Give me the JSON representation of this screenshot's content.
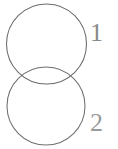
{
  "figure": {
    "kind": "venn-two-circle-diagram",
    "background_color": "#ffffff",
    "stroke_color": "#6b6b6b",
    "label_color": "#8a8a8a",
    "width": 118,
    "height": 149
  },
  "shapes": {
    "top_circle": {
      "name": "circle-1",
      "cx": 46.5,
      "cy": 44,
      "r": 40,
      "stroke": "#6b6b6b"
    },
    "bottom_circle": {
      "name": "circle-2",
      "cx": 46,
      "cy": 106,
      "r": 39,
      "stroke": "#6f6f6f"
    }
  },
  "labels": {
    "top": {
      "text": "1",
      "x": 90,
      "y": 41,
      "font_size": 26,
      "color": "#8a8a8a"
    },
    "bottom": {
      "text": "2",
      "x": 90,
      "y": 131,
      "font_size": 26,
      "color": "#9a9a9a"
    }
  }
}
